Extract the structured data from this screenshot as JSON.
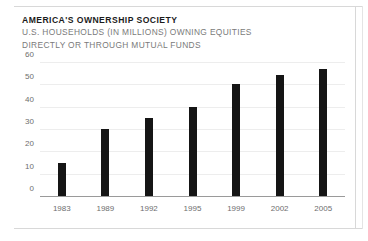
{
  "header": {
    "title": "AMERICA'S OWNERSHIP SOCIETY",
    "subtitle_line1": "U.S. HOUSEHOLDS (IN MILLIONS) OWNING EQUITIES",
    "subtitle_line2": "DIRECTLY OR THROUGH MUTUAL FUNDS"
  },
  "colors": {
    "bar": "#151515",
    "gridline": "#ededed",
    "axis": "#9a9a9a",
    "tick_text": "#6e6e6e",
    "title_text": "#1b1b1b",
    "subtitle_text": "#7a7a7a",
    "frame_rule": "#d8d8d8",
    "background": "#ffffff"
  },
  "chart_data": {
    "type": "bar",
    "title": "AMERICA'S OWNERSHIP SOCIETY",
    "subtitle": "U.S. HOUSEHOLDS (IN MILLIONS) OWNING EQUITIES DIRECTLY OR THROUGH MUTUAL FUNDS",
    "categories": [
      "1983",
      "1989",
      "1992",
      "1995",
      "1999",
      "2002",
      "2005"
    ],
    "values": [
      15,
      30,
      35,
      40,
      50,
      54,
      57
    ],
    "xlabel": "",
    "ylabel": "",
    "ylim": [
      0,
      60
    ],
    "yticks": [
      0,
      10,
      20,
      30,
      40,
      50,
      60
    ],
    "ytick_labels": [
      "0",
      "10",
      "20",
      "30",
      "40",
      "50",
      "60"
    ],
    "grid": true,
    "legend": false,
    "units": "millions of households"
  }
}
